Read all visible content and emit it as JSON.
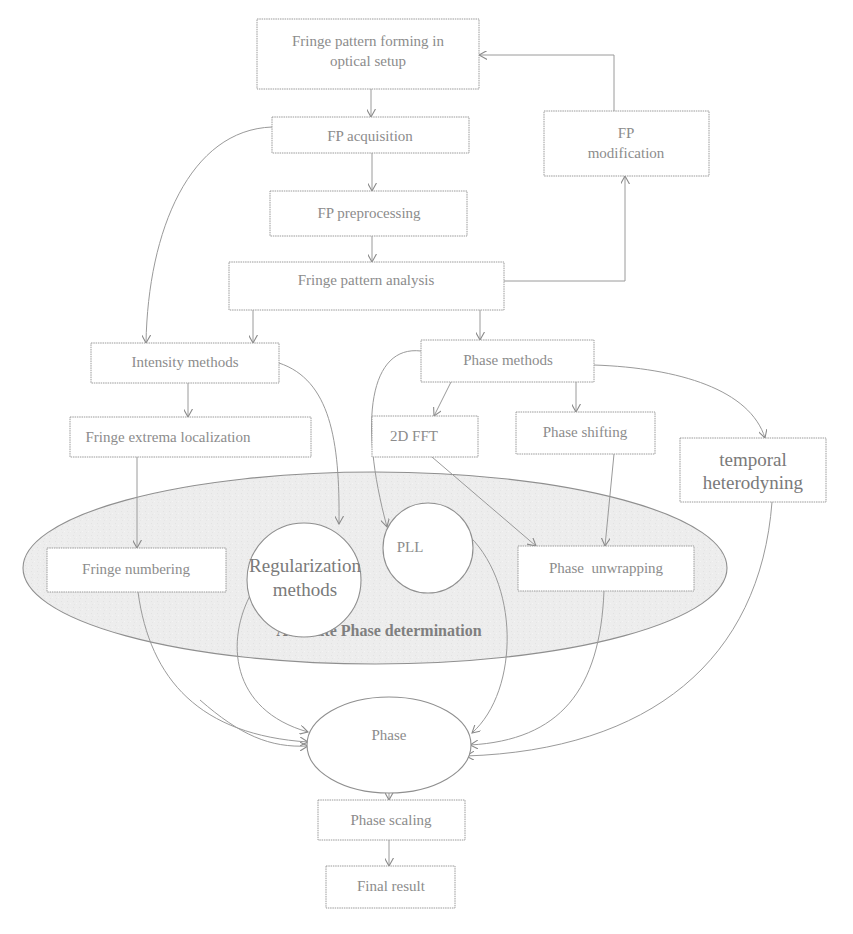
{
  "diagram": {
    "nodes": {
      "fp_forming": {
        "line1": "Fringe pattern forming in",
        "line2": "optical setup"
      },
      "fp_acquisition": {
        "label": "FP acquisition"
      },
      "fp_modification": {
        "line1": "FP",
        "line2": "modification"
      },
      "fp_preprocessing": {
        "label": "FP preprocessing"
      },
      "fp_analysis": {
        "label": "Fringe pattern analysis"
      },
      "intensity_methods": {
        "label": "Intensity methods"
      },
      "phase_methods": {
        "label": "Phase methods"
      },
      "fringe_extrema": {
        "label": "Fringe extrema localization"
      },
      "fft_2d": {
        "label": "2D FFT"
      },
      "phase_shifting": {
        "label": "Phase shifting"
      },
      "temporal_heterodyning": {
        "line1": "temporal",
        "line2": "heterodyning"
      },
      "fringe_numbering": {
        "label": "Fringe numbering"
      },
      "regularization": {
        "line1": "Regularization",
        "line2": "methods"
      },
      "pll": {
        "label": "PLL"
      },
      "phase_unwrapping": {
        "label": "Phase  unwrapping"
      },
      "absolute_phase_region": {
        "label": "Absolute Phase determination"
      },
      "phase": {
        "label": "Phase"
      },
      "phase_scaling": {
        "label": "Phase scaling"
      },
      "final_result": {
        "label": "Final result"
      }
    },
    "edges": [
      {
        "from": "fp_forming",
        "to": "fp_acquisition"
      },
      {
        "from": "fp_acquisition",
        "to": "fp_preprocessing"
      },
      {
        "from": "fp_acquisition",
        "to": "intensity_methods"
      },
      {
        "from": "fp_preprocessing",
        "to": "fp_analysis"
      },
      {
        "from": "fp_analysis",
        "to": "fp_modification"
      },
      {
        "from": "fp_modification",
        "to": "fp_forming"
      },
      {
        "from": "fp_analysis",
        "to": "intensity_methods"
      },
      {
        "from": "fp_analysis",
        "to": "phase_methods"
      },
      {
        "from": "intensity_methods",
        "to": "fringe_extrema"
      },
      {
        "from": "intensity_methods",
        "to": "regularization"
      },
      {
        "from": "phase_methods",
        "to": "pll"
      },
      {
        "from": "phase_methods",
        "to": "fft_2d"
      },
      {
        "from": "phase_methods",
        "to": "phase_shifting"
      },
      {
        "from": "phase_methods",
        "to": "temporal_heterodyning"
      },
      {
        "from": "fringe_extrema",
        "to": "fringe_numbering"
      },
      {
        "from": "fft_2d",
        "to": "phase_unwrapping"
      },
      {
        "from": "phase_shifting",
        "to": "phase_unwrapping"
      },
      {
        "from": "fringe_numbering",
        "to": "phase"
      },
      {
        "from": "regularization",
        "to": "phase"
      },
      {
        "from": "pll",
        "to": "phase"
      },
      {
        "from": "phase_unwrapping",
        "to": "phase"
      },
      {
        "from": "temporal_heterodyning",
        "to": "phase"
      },
      {
        "from": "phase",
        "to": "phase_scaling"
      },
      {
        "from": "phase_scaling",
        "to": "final_result"
      }
    ],
    "colors": {
      "line": "#9a9a9a",
      "text": "#8c8c8c",
      "region_fill": "#ececec",
      "background": "#ffffff"
    }
  }
}
